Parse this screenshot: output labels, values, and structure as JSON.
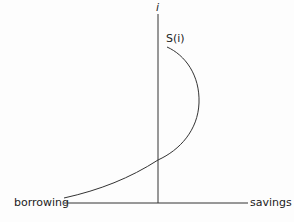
{
  "diagram": {
    "title": "",
    "y_axis_label": "i",
    "curve_label": "S(i)",
    "x_axis_left_label": "borrowing",
    "x_axis_right_label": "savings",
    "line_color": "#333333"
  }
}
